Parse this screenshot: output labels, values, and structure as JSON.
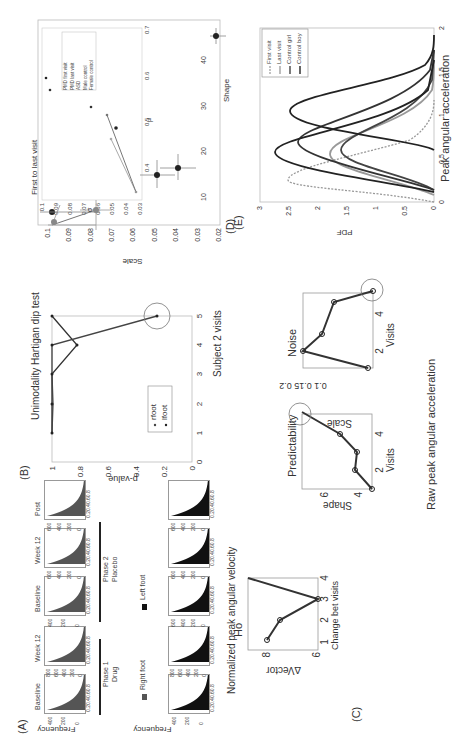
{
  "panels": {
    "A": {
      "label": "(A)",
      "ylabel": "Frequency",
      "xticks": "0.20.40.60.8",
      "top_row": [
        {
          "title": "Baseline",
          "yticks": [
            "400",
            "200",
            "0"
          ],
          "shade": "#555"
        },
        {
          "title": "Week 12",
          "yticks": [
            "800",
            "600",
            "400",
            "200",
            "0"
          ],
          "shade": "#555"
        },
        {
          "title": "Baseline",
          "yticks": [
            "400",
            "200",
            "0"
          ],
          "shade": "#555"
        },
        {
          "title": "Week 12",
          "yticks": [
            "600",
            "400",
            "200",
            "0"
          ],
          "shade": "#555"
        },
        {
          "title": "Post",
          "yticks": [
            "600",
            "400",
            "200",
            "0"
          ],
          "shade": "#555"
        }
      ],
      "bottom_row": [
        {
          "yticks": [
            "400",
            "200",
            "0"
          ],
          "shade": "#111"
        },
        {
          "yticks": [
            "800",
            "600",
            "400",
            "200",
            "0"
          ],
          "shade": "#111"
        },
        {
          "yticks": [
            "600",
            "400",
            "200",
            "0"
          ],
          "shade": "#111"
        },
        {
          "yticks": [
            "600",
            "400",
            "200",
            "0"
          ],
          "shade": "#111"
        },
        {
          "yticks": [
            "600",
            "400",
            "200",
            "0"
          ],
          "shade": "#111"
        }
      ],
      "phases": [
        {
          "name": "Phase 1",
          "sub": "Drug"
        },
        {
          "name": "Phase 2",
          "sub": "Placebo"
        }
      ],
      "legend": [
        {
          "label": "Right foot",
          "color": "#555"
        },
        {
          "label": "Left foot",
          "color": "#111"
        }
      ],
      "caption": "Normalized peak angular velocity"
    },
    "B": {
      "label": "(B)",
      "title": "Unimodality Hartigan dip test",
      "xlabel": "Subject 2 visits",
      "ylabel": "p-value"
    },
    "C": {
      "label": "(C)",
      "caption": "Raw peak angular acceleration",
      "ho": {
        "title": "Ho",
        "xlabel": "Change bet visits",
        "ylabel": "∆Vector"
      },
      "pred": {
        "title": "Predictability",
        "xlabel": "Visits",
        "ylabel": "Shape"
      },
      "noise": {
        "title": "Noise",
        "xlabel": "Visits",
        "ylabel": "Scale"
      }
    },
    "D": {
      "label": "(D)",
      "xlabel": "Shape",
      "ylabel": "Scale",
      "inset_title": "First to last visit",
      "inset_xlabel": "μ",
      "inset_ylabel": "σ",
      "inset_legend": [
        "PMD first visit",
        "PMD last visit",
        "ASD",
        "Male control",
        "Female control"
      ]
    },
    "E": {
      "label": "(E)",
      "xlabel": "Peak angular acceleration",
      "ylabel": "PDF",
      "legend": [
        "First visit",
        "Last visit",
        "Control girl",
        "Control boy"
      ]
    }
  },
  "chart_data": [
    {
      "type": "bar",
      "title": "(A) Normalized peak angular velocity histograms",
      "xlabel": "",
      "ylabel": "Frequency",
      "categories": [
        "Baseline (Phase 1 Drug)",
        "Week 12 (Phase 1 Drug)",
        "Baseline (Phase 2 Placebo)",
        "Week 12 (Phase 2 Placebo)",
        "Post"
      ],
      "series": [
        {
          "name": "Right foot"
        },
        {
          "name": "Left foot"
        }
      ],
      "xlim": [
        0,
        0.9
      ]
    },
    {
      "type": "line",
      "title": "Unimodality Hartigan dip test",
      "xlabel": "Subject 2 visits",
      "ylabel": "p-value",
      "x": [
        1,
        2,
        3,
        4,
        5
      ],
      "series": [
        {
          "name": "rfoot",
          "values": [
            1.0,
            1.0,
            1.0,
            0.82,
            1.0
          ]
        },
        {
          "name": "lfoot",
          "values": [
            1.0,
            1.0,
            1.0,
            1.0,
            0.25
          ]
        }
      ],
      "ylim": [
        0,
        1
      ],
      "xlim": [
        0,
        5
      ],
      "xticks": [
        0,
        1,
        2,
        3,
        4,
        5
      ],
      "yticks": [
        0,
        0.2,
        0.4,
        0.6,
        0.8,
        1
      ],
      "legend_position": "inside-middle",
      "annotations": [
        "circle at visit 5 (p≈0.25)"
      ]
    },
    {
      "type": "line",
      "title": "Ho",
      "xlabel": "Change bet visits",
      "ylabel": "∆Vector",
      "x": [
        1,
        2,
        3,
        4
      ],
      "values": [
        7.7,
        7.2,
        6.0,
        10.0
      ],
      "xticks": [
        1,
        2,
        3,
        4
      ],
      "yticks": [
        6,
        8
      ]
    },
    {
      "type": "line",
      "title": "Predictability",
      "xlabel": "Visits",
      "ylabel": "Shape",
      "x": [
        1,
        2,
        3,
        4,
        5
      ],
      "values": [
        3.8,
        4.6,
        4.5,
        5.2,
        7.2
      ],
      "xticks": [
        2,
        4
      ],
      "yticks": [
        4,
        6
      ],
      "annotations": [
        "circle at visit 5"
      ]
    },
    {
      "type": "line",
      "title": "Noise",
      "xlabel": "Visits",
      "ylabel": "Scale",
      "x": [
        1,
        2,
        3,
        4,
        5
      ],
      "values": [
        0.1,
        0.25,
        0.22,
        0.16,
        0.12
      ],
      "xticks": [
        2,
        4
      ],
      "yticks": [
        0.1,
        0.15,
        0.2
      ],
      "annotations": [
        "circle at visit 5"
      ]
    },
    {
      "type": "scatter",
      "title": "(D)",
      "xlabel": "Shape",
      "ylabel": "Scale",
      "xticks": [
        10,
        20,
        30,
        40
      ],
      "yticks": [
        0.02,
        0.03,
        0.04,
        0.05,
        0.06,
        0.07,
        0.08,
        0.09,
        0.1
      ],
      "xlim": [
        4,
        49
      ],
      "ylim": [
        0.02,
        0.105
      ],
      "series": [
        {
          "name": "PMD first visit",
          "points": [
            [
              5,
              0.098
            ],
            [
              9,
              0.093
            ]
          ]
        },
        {
          "name": "PMD last visit",
          "points": [
            [
              8,
              0.08
            ],
            [
              5,
              0.098
            ]
          ]
        },
        {
          "name": "ASD",
          "points": [
            [
              8,
              0.098
            ]
          ]
        },
        {
          "name": "Male control",
          "points": [
            [
              15.5,
              0.045
            ],
            [
              17,
              0.035
            ]
          ]
        },
        {
          "name": "Female control",
          "points": [
            [
              46,
              0.022
            ]
          ]
        }
      ]
    },
    {
      "type": "scatter",
      "title": "First to last visit",
      "xlabel": "μ",
      "ylabel": "σ",
      "xticks": [
        0.4,
        0.5,
        0.6,
        0.7
      ],
      "yticks": [
        0.03,
        0.04,
        0.05,
        0.06,
        0.07,
        0.08,
        0.09,
        0.1
      ],
      "xlim": [
        0.33,
        0.7
      ],
      "ylim": [
        0.03,
        0.1
      ],
      "series": [
        {
          "name": "PMD first visit",
          "points": [
            [
              0.38,
              0.037
            ],
            [
              0.51,
              0.05
            ]
          ]
        },
        {
          "name": "PMD last visit",
          "points": [
            [
              0.34,
              0.033
            ],
            [
              0.62,
              0.05
            ]
          ]
        },
        {
          "name": "ASD",
          "points": [
            [
              0.62,
              0.096
            ],
            [
              0.67,
              0.099
            ]
          ]
        },
        {
          "name": "Male control",
          "points": [
            [
              0.54,
              0.045
            ]
          ]
        },
        {
          "name": "Female control",
          "points": [
            [
              0.57,
              0.067
            ]
          ]
        }
      ],
      "legend_position": "upper-right"
    },
    {
      "type": "line",
      "title": "(E)",
      "xlabel": "Peak angular acceleration",
      "ylabel": "PDF",
      "xticks": [
        0,
        0.5,
        1,
        1.5,
        2
      ],
      "yticks": [
        0,
        0.5,
        1,
        1.5,
        2,
        2.5,
        3
      ],
      "xlim": [
        0,
        2
      ],
      "ylim": [
        0,
        3
      ],
      "series": [
        {
          "name": "First visit",
          "style": "dotted",
          "peak_x": 0.25,
          "peak_y": 2.5
        },
        {
          "name": "Last visit",
          "peak_x": 0.55,
          "peak_y": 1.8
        },
        {
          "name": "Control girl",
          "peak_x": 0.6,
          "peak_y": 1.6
        },
        {
          "name": "Control girl 2",
          "peak_x": 0.7,
          "peak_y": 2.35
        },
        {
          "name": "Control boy",
          "peak_x": 0.58,
          "peak_y": 2.75
        },
        {
          "name": "Control boy 2",
          "peak_x": 1.05,
          "peak_y": 2.45
        }
      ],
      "legend_position": "upper-right"
    }
  ]
}
